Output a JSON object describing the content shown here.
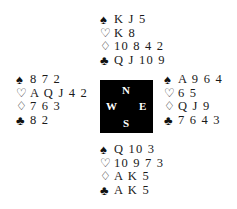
{
  "diagram": {
    "type": "bridge-deal",
    "compass": {
      "north": "N",
      "south": "S",
      "west": "W",
      "east": "E",
      "background": "#000000",
      "text_color": "#ffffff"
    },
    "suit_symbols": {
      "spades": "♠",
      "hearts": "♡",
      "diamonds": "♢",
      "clubs": "♣"
    },
    "hands": {
      "north": {
        "spades": "K J 5",
        "hearts": "K 8",
        "diamonds": "10 8 4 2",
        "clubs": "Q J 10 9"
      },
      "west": {
        "spades": "8 7 2",
        "hearts": "A Q J 4 2",
        "diamonds": "7 6 3",
        "clubs": "8 2"
      },
      "east": {
        "spades": "A 9 6 4",
        "hearts": "6 5",
        "diamonds": "Q J 9",
        "clubs": "7 6 4 3"
      },
      "south": {
        "spades": "Q 10 3",
        "hearts": "10 9 7 3",
        "diamonds": "A K 5",
        "clubs": "A K 5"
      }
    }
  }
}
